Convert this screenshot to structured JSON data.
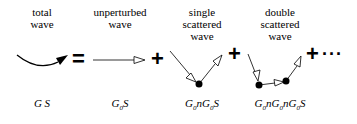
{
  "terms": [
    {
      "label_line1": "total",
      "label_line2": "wave",
      "label_line3": "",
      "formula_parts": [
        "G",
        " S"
      ]
    },
    {
      "label_line1": "unperturbed",
      "label_line2": "wave",
      "label_line3": "",
      "formula_parts": [
        "G",
        "0",
        "S"
      ]
    },
    {
      "label_line1": "single",
      "label_line2": "scattered",
      "label_line3": "wave",
      "formula_parts": [
        "G",
        "0",
        "nG",
        "0",
        "S"
      ]
    },
    {
      "label_line1": "double",
      "label_line2": "scattered",
      "label_line3": "wave",
      "formula_parts": [
        "G",
        "0",
        "nG",
        "0",
        "nG",
        "0",
        "S"
      ]
    }
  ],
  "operators": {
    "equals": "=",
    "plus": "+",
    "ellipsis": "···"
  },
  "colors": {
    "ink": "#000000",
    "background": "#ffffff"
  }
}
